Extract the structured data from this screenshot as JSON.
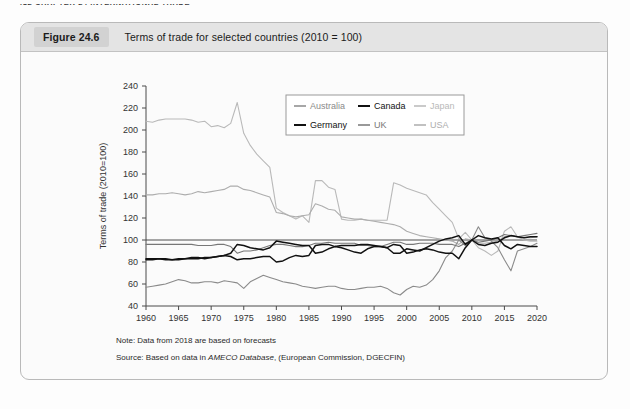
{
  "running_head": "412   CHAPTER 24  INTERNATIONAL TRADE",
  "figure": {
    "number_label": "Figure 24.6",
    "title": "Terms of trade for selected countries (2010  =  100)",
    "note": "Note: Data from 2018 are based on forecasts",
    "source_prefix": "Source: Based on data in ",
    "source_italic": "AMECO Database",
    "source_suffix": ", (European Commission, DGECFIN)"
  },
  "colors": {
    "australia": "#8a8a8a",
    "canada": "#111111",
    "japan": "#b9b9b9",
    "germany": "#111111",
    "uk": "#777777",
    "usa": "#adadad",
    "axis": "#4a4a4a",
    "caption_bar": "#e4e4e4",
    "figure_border": "#b9b9b9"
  },
  "chart_data": {
    "type": "line",
    "title": "Terms of trade for selected countries (2010 = 100)",
    "xlabel": "",
    "ylabel": "Terms of trade (2010=100)",
    "xlim": [
      1960,
      2020
    ],
    "ylim": [
      40,
      240
    ],
    "xticks": [
      1960,
      1965,
      1970,
      1975,
      1980,
      1985,
      1990,
      1995,
      2000,
      2005,
      2010,
      2015,
      2020
    ],
    "yticks": [
      40,
      60,
      80,
      100,
      120,
      140,
      160,
      180,
      200,
      220,
      240
    ],
    "grid": false,
    "legend_position": "top-right",
    "x": [
      1960,
      1961,
      1962,
      1963,
      1964,
      1965,
      1966,
      1967,
      1968,
      1969,
      1970,
      1971,
      1972,
      1973,
      1974,
      1975,
      1976,
      1977,
      1978,
      1979,
      1980,
      1981,
      1982,
      1983,
      1984,
      1985,
      1986,
      1987,
      1988,
      1989,
      1990,
      1991,
      1992,
      1993,
      1994,
      1995,
      1996,
      1997,
      1998,
      1999,
      2000,
      2001,
      2002,
      2003,
      2004,
      2005,
      2006,
      2007,
      2008,
      2009,
      2010,
      2011,
      2012,
      2013,
      2014,
      2015,
      2016,
      2017,
      2018,
      2019,
      2020
    ],
    "series": [
      {
        "name": "Japan",
        "color": "#b9b9b9",
        "values": [
          208,
          207,
          209,
          210,
          210,
          210,
          210,
          209,
          207,
          208,
          203,
          204,
          202,
          206,
          225,
          197,
          186,
          178,
          172,
          166,
          129,
          125,
          122,
          119,
          122,
          116,
          154,
          154,
          148,
          146,
          119,
          118,
          118,
          119,
          118,
          118,
          118,
          118,
          152,
          150,
          147,
          145,
          143,
          141,
          134,
          128,
          122,
          116,
          101,
          107,
          100,
          93,
          90,
          86,
          90,
          108,
          112,
          103,
          100,
          99,
          99
        ]
      },
      {
        "name": "USA",
        "color": "#adadad",
        "values": [
          141,
          141,
          142,
          142,
          143,
          142,
          141,
          142,
          144,
          143,
          144,
          145,
          146,
          149,
          149,
          146,
          145,
          143,
          141,
          139,
          125,
          124,
          122,
          121,
          122,
          123,
          133,
          131,
          128,
          127,
          121,
          120,
          119,
          119,
          118,
          117,
          116,
          115,
          114,
          112,
          108,
          106,
          104,
          103,
          102,
          101,
          100,
          99,
          96,
          101,
          100,
          97,
          97,
          98,
          99,
          103,
          104,
          103,
          102,
          102,
          103
        ]
      },
      {
        "name": "Australia",
        "color": "#8a8a8a",
        "values": [
          57,
          58,
          59,
          60,
          62,
          64,
          63,
          61,
          61,
          62,
          62,
          61,
          63,
          62,
          61,
          56,
          62,
          65,
          68,
          66,
          64,
          62,
          61,
          60,
          58,
          57,
          56,
          57,
          58,
          58,
          56,
          55,
          55,
          56,
          57,
          57,
          58,
          56,
          52,
          50,
          55,
          58,
          57,
          59,
          64,
          72,
          84,
          90,
          100,
          95,
          100,
          112,
          102,
          99,
          93,
          82,
          72,
          90,
          92,
          94,
          97
        ]
      },
      {
        "name": "Germany",
        "color": "#111111",
        "values": [
          83,
          83,
          83,
          83,
          82,
          82,
          83,
          84,
          84,
          83,
          84,
          85,
          86,
          85,
          82,
          83,
          83,
          84,
          85,
          85,
          80,
          81,
          84,
          86,
          85,
          86,
          95,
          96,
          96,
          94,
          95,
          95,
          95,
          96,
          96,
          95,
          94,
          93,
          96,
          95,
          88,
          89,
          91,
          92,
          91,
          89,
          88,
          88,
          83,
          93,
          100,
          96,
          95,
          97,
          98,
          102,
          104,
          103,
          102,
          103,
          103
        ]
      },
      {
        "name": "Canada",
        "color": "#111111",
        "values": [
          82,
          82,
          83,
          82,
          82,
          83,
          83,
          83,
          83,
          84,
          84,
          85,
          86,
          88,
          96,
          95,
          93,
          92,
          91,
          93,
          99,
          98,
          97,
          96,
          95,
          95,
          88,
          89,
          92,
          94,
          93,
          91,
          89,
          88,
          92,
          94,
          94,
          93,
          88,
          88,
          92,
          91,
          90,
          93,
          96,
          99,
          101,
          102,
          104,
          96,
          100,
          104,
          102,
          101,
          102,
          95,
          92,
          96,
          95,
          94,
          94
        ]
      },
      {
        "name": "UK",
        "color": "#777777",
        "values": [
          96,
          96,
          96,
          96,
          96,
          96,
          96,
          96,
          95,
          95,
          95,
          96,
          96,
          94,
          88,
          90,
          90,
          91,
          93,
          95,
          96,
          96,
          95,
          94,
          94,
          95,
          97,
          97,
          98,
          97,
          97,
          97,
          97,
          95,
          95,
          94,
          94,
          96,
          98,
          98,
          96,
          96,
          97,
          97,
          97,
          96,
          96,
          96,
          94,
          97,
          100,
          98,
          99,
          100,
          102,
          105,
          104,
          103,
          104,
          105,
          106
        ]
      }
    ],
    "legend": [
      {
        "label": "Australia",
        "color": "#8a8a8a"
      },
      {
        "label": "Canada",
        "color": "#111111"
      },
      {
        "label": "Japan",
        "color": "#b9b9b9"
      },
      {
        "label": "Germany",
        "color": "#111111"
      },
      {
        "label": "UK",
        "color": "#777777"
      },
      {
        "label": "USA",
        "color": "#adadad"
      }
    ]
  }
}
